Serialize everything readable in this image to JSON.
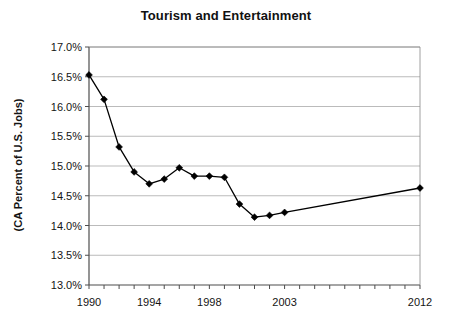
{
  "chart_data": {
    "type": "line",
    "title": "Tourism and Entertainment",
    "xlabel": "",
    "ylabel": "(CA Percent of U.S. Jobs)",
    "x": [
      1990,
      1991,
      1992,
      1993,
      1994,
      1995,
      1996,
      1997,
      1998,
      1999,
      2000,
      2001,
      2002,
      2003,
      2012
    ],
    "values": [
      16.53,
      16.12,
      15.32,
      14.9,
      14.7,
      14.78,
      14.97,
      14.83,
      14.83,
      14.81,
      14.36,
      14.14,
      14.17,
      14.22,
      14.63
    ],
    "series": [
      {
        "name": "CA Percent of U.S. Jobs",
        "values": [
          16.53,
          16.12,
          15.32,
          14.9,
          14.7,
          14.78,
          14.97,
          14.83,
          14.83,
          14.81,
          14.36,
          14.14,
          14.17,
          14.22,
          14.63
        ]
      }
    ],
    "ylim": [
      13.0,
      17.0
    ],
    "xlim": [
      1990,
      2012
    ],
    "ytick_values": [
      13.0,
      13.5,
      14.0,
      14.5,
      15.0,
      15.5,
      16.0,
      16.5,
      17.0
    ],
    "ytick_labels": [
      "13.0%",
      "13.5%",
      "14.0%",
      "14.5%",
      "15.0%",
      "15.5%",
      "16.0%",
      "16.5%",
      "17.0%"
    ],
    "xtick_values": [
      1990,
      1994,
      1998,
      2003,
      2012
    ],
    "xtick_labels": [
      "1990",
      "1994",
      "1998",
      "2003",
      "2012"
    ],
    "xtick_all_years": [
      1990,
      1991,
      1992,
      1993,
      1994,
      1995,
      1996,
      1997,
      1998,
      1999,
      2000,
      2001,
      2002,
      2003,
      2004,
      2005,
      2006,
      2007,
      2008,
      2009,
      2010,
      2011,
      2012
    ],
    "grid": "horizontal",
    "legend": "none",
    "marker": "diamond",
    "line_color": "#000000",
    "marker_color": "#000000",
    "grid_color": "#aaaaaa",
    "axis_color": "#555555",
    "background": "#ffffff"
  },
  "axis": {
    "y_title": "(CA Percent of U.S. Jobs)"
  },
  "header": {
    "title": "Tourism and Entertainment"
  }
}
